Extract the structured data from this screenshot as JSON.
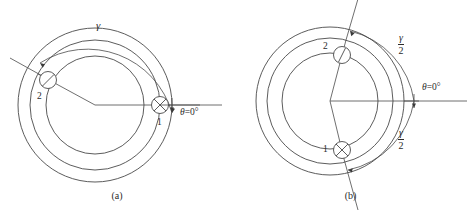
{
  "figure": {
    "panels": [
      {
        "id": "a",
        "caption": "(a)",
        "arc_label": "γ",
        "axis_label_theta": "θ",
        "axis_label_equals": "=",
        "axis_label_value": "0°",
        "conductors": [
          {
            "id": "1",
            "label": "1",
            "marker": "cross-circle-icon",
            "current": "into-page"
          },
          {
            "id": "2",
            "label": "2",
            "marker": "slash-circle-icon",
            "current": "out-of-page"
          }
        ]
      },
      {
        "id": "b",
        "caption": "(b)",
        "arc_label_upper_num": "γ",
        "arc_label_upper_den": "2",
        "arc_label_lower_num": "γ",
        "arc_label_lower_den": "2",
        "axis_label_theta": "θ",
        "axis_label_equals": "=",
        "axis_label_value": "0°",
        "conductors": [
          {
            "id": "1",
            "label": "1",
            "marker": "cross-circle-icon",
            "current": "into-page"
          },
          {
            "id": "2",
            "label": "2",
            "marker": "slash-circle-icon",
            "current": "out-of-page"
          }
        ]
      }
    ],
    "colors": {
      "line": "#4a4a4a",
      "text": "#2b2b2b",
      "background": "#ffffff"
    }
  }
}
